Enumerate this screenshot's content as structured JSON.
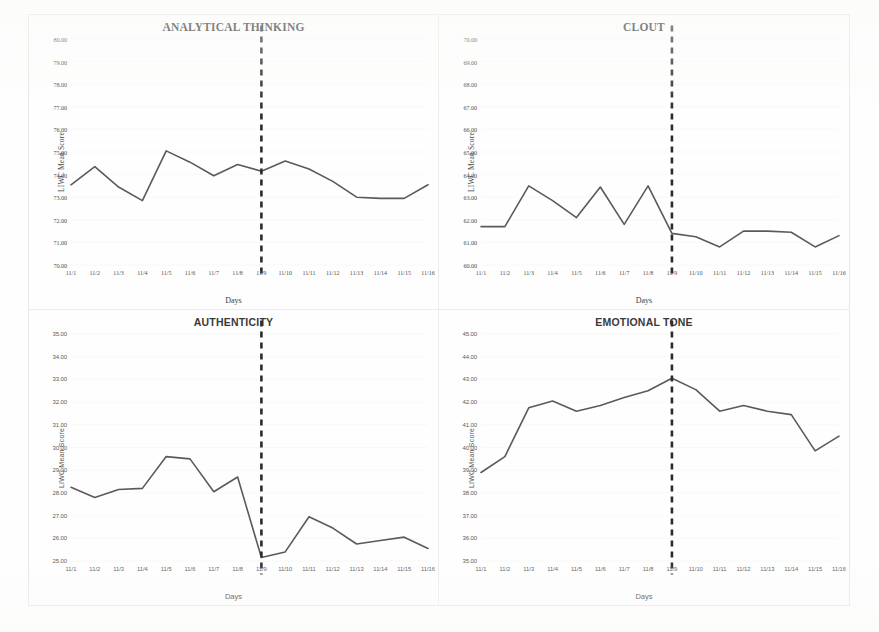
{
  "page": {
    "background": "#fefefe",
    "line_color": "#5a5a5a",
    "marker_color": "#3d3d3d",
    "gridline_color": "#ededea"
  },
  "axis_titles": {
    "y": "LIWC Mean Score",
    "x": "Days"
  },
  "event_line": {
    "label": "11/9",
    "color": "#2b2b2b",
    "style": "dashed"
  },
  "chart_data": [
    {
      "type": "line",
      "title": "ANALYTICAL THINKING",
      "xlabel": "Days",
      "ylabel": "LIWC Mean Score",
      "grid": true,
      "ylim": [
        70.0,
        80.0
      ],
      "ystep": 1.0,
      "ytick_labels": [
        "80.00",
        "79.00",
        "78.00",
        "77.00",
        "76.00",
        "75.00",
        "74.00",
        "73.00",
        "72.00",
        "71.00",
        "70.00"
      ],
      "categories": [
        "11/1",
        "11/2",
        "11/3",
        "11/4",
        "11/5",
        "11/6",
        "11/7",
        "11/8",
        "11/9",
        "11/10",
        "11/11",
        "11/12",
        "11/13",
        "11/14",
        "11/15",
        "11/16"
      ],
      "values": [
        73.55,
        74.35,
        73.45,
        72.85,
        75.05,
        74.55,
        73.95,
        74.45,
        74.15,
        74.6,
        74.25,
        73.7,
        73.0,
        72.95,
        72.95,
        73.55
      ],
      "annotation": "dashed reference line at 11/9"
    },
    {
      "type": "line",
      "title": "CLOUT",
      "xlabel": "Days",
      "ylabel": "LIWC Mean Score",
      "grid": true,
      "ylim": [
        60.0,
        70.0
      ],
      "ystep": 1.0,
      "ytick_labels": [
        "70.00",
        "69.00",
        "68.00",
        "67.00",
        "66.00",
        "65.00",
        "64.00",
        "63.00",
        "62.00",
        "61.00",
        "60.00"
      ],
      "categories": [
        "11/1",
        "11/2",
        "11/3",
        "11/4",
        "11/5",
        "11/6",
        "11/7",
        "11/8",
        "11/9",
        "11/10",
        "11/11",
        "11/12",
        "11/13",
        "11/14",
        "11/15",
        "11/16"
      ],
      "values": [
        61.7,
        61.7,
        63.5,
        62.85,
        62.1,
        63.45,
        61.8,
        63.5,
        61.4,
        61.25,
        60.8,
        61.5,
        61.5,
        61.45,
        60.8,
        61.3
      ],
      "annotation": "dashed reference line at 11/9"
    },
    {
      "type": "line",
      "title": "AUTHENTICITY",
      "xlabel": "Days",
      "ylabel": "LIWC Mean Score",
      "grid": true,
      "ylim": [
        25.0,
        35.0
      ],
      "ystep": 1.0,
      "ytick_labels": [
        "35.00",
        "34.00",
        "33.00",
        "32.00",
        "31.00",
        "30.00",
        "29.00",
        "28.00",
        "27.00",
        "26.00",
        "25.00"
      ],
      "categories": [
        "11/1",
        "11/2",
        "11/3",
        "11/4",
        "11/5",
        "11/6",
        "11/7",
        "11/8",
        "11/9",
        "11/10",
        "11/11",
        "11/12",
        "11/13",
        "11/14",
        "11/15",
        "11/16"
      ],
      "values": [
        28.25,
        27.8,
        28.15,
        28.2,
        29.6,
        29.5,
        28.05,
        28.7,
        25.15,
        25.4,
        26.95,
        26.45,
        25.75,
        25.9,
        26.05,
        25.55
      ],
      "annotation": "dashed reference line at 11/9"
    },
    {
      "type": "line",
      "title": "EMOTIONAL TONE",
      "xlabel": "Days",
      "ylabel": "LIWC Mean Score",
      "grid": true,
      "ylim": [
        35.0,
        45.0
      ],
      "ystep": 1.0,
      "ytick_labels": [
        "45.00",
        "44.00",
        "43.00",
        "42.00",
        "41.00",
        "40.00",
        "39.00",
        "38.00",
        "37.00",
        "36.00",
        "35.00"
      ],
      "categories": [
        "11/1",
        "11/2",
        "11/3",
        "11/4",
        "11/5",
        "11/6",
        "11/7",
        "11/8",
        "11/9",
        "11/10",
        "11/11",
        "11/12",
        "11/13",
        "11/14",
        "11/15",
        "11/16"
      ],
      "values": [
        38.9,
        39.6,
        41.75,
        42.05,
        41.6,
        41.85,
        42.2,
        42.5,
        43.05,
        42.55,
        41.6,
        41.85,
        41.6,
        41.45,
        39.85,
        40.5
      ],
      "annotation": "dashed reference line at 11/9"
    }
  ]
}
